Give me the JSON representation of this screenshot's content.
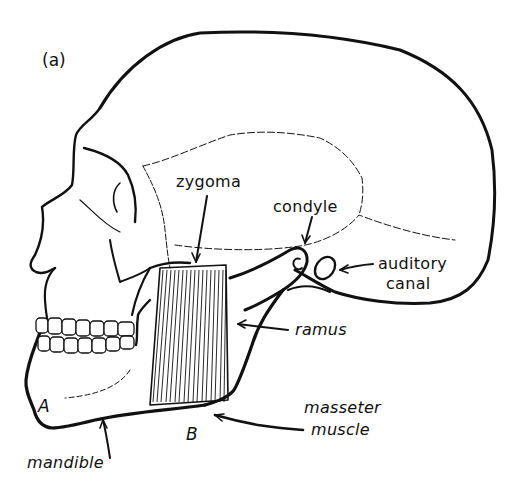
{
  "figure": {
    "panel_label": "(a)",
    "line_color": "#111111",
    "background": "#ffffff"
  },
  "labels": {
    "zygoma": "zygoma",
    "condyle": "condyle",
    "condyle_marker": "C",
    "auditory_canal_line1": "auditory",
    "auditory_canal_line2": "canal",
    "ramus": "ramus",
    "masseter_line1": "masseter",
    "masseter_line2": "muscle",
    "mandible": "mandible",
    "point_a": "A",
    "point_b": "B"
  }
}
